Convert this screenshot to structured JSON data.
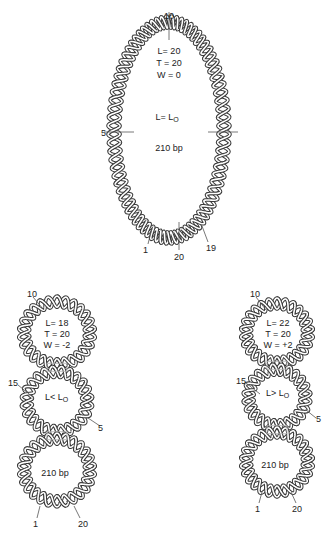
{
  "figure": {
    "panels": [
      {
        "id": "relaxed",
        "stats": {
          "L": "L= 20",
          "T": "T = 20",
          "W": "W = 0"
        },
        "relation": {
          "left": "L= L",
          "sub": "O"
        },
        "size": "210 bp",
        "markers": {
          "top": "10",
          "left": "5",
          "bottom_left": "1",
          "bottom": "20",
          "bottom_right": "19"
        }
      },
      {
        "id": "negative",
        "stats": {
          "L": "L= 18",
          "T": "T = 20",
          "W": "W = -2"
        },
        "relation": {
          "left": "L< L",
          "sub": "O"
        },
        "size": "210 bp",
        "markers": {
          "top": "10",
          "left": "15",
          "right": "5",
          "bottom_left": "1",
          "bottom_right": "20"
        }
      },
      {
        "id": "positive",
        "stats": {
          "L": "L= 22",
          "T": "T = 20",
          "W": "W = +2"
        },
        "relation": {
          "left": "L> L",
          "sub": "O"
        },
        "size": "210 bp",
        "markers": {
          "top": "10",
          "left": "15",
          "right": "5",
          "bottom_left": "1",
          "bottom_right": "20"
        }
      }
    ],
    "colors": {
      "strand_outline": "#3a3a3a",
      "strand_fill": "#ffffff",
      "tick": "#555555",
      "crossover": "#b0b0b0"
    }
  }
}
